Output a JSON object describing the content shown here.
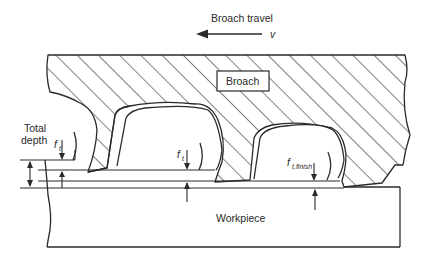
{
  "diagram": {
    "type": "technical-schematic",
    "labels": {
      "travel": "Broach travel",
      "velocity": "v",
      "broach": "Broach",
      "total_depth_line1": "Total",
      "total_depth_line2": "depth",
      "feed_1": "f",
      "feed_1_sub": "t",
      "feed_2": "f",
      "feed_2_sub": "t",
      "feed_finish": "f",
      "feed_finish_sub": "t,finish",
      "workpiece": "Workpiece"
    },
    "elements": [
      {
        "name": "broach",
        "style": "hatched cross-section",
        "teeth": 3
      },
      {
        "name": "workpiece",
        "style": "plain cross-section"
      },
      {
        "name": "travel-arrow",
        "direction": "left"
      },
      {
        "name": "total-depth-dimension"
      },
      {
        "name": "tooth-rise-dimensions",
        "count": 3
      }
    ],
    "colors": {
      "line": "#2a2a2a",
      "background": "#ffffff"
    }
  }
}
